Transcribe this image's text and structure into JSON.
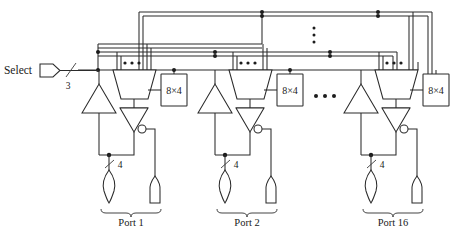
{
  "figure": {
    "type": "circuit-schematic",
    "input_label": "Select",
    "select_bus_width": "3",
    "port_bus_width": "4",
    "decoder_label": "8×4",
    "horizontal_ellipsis": "•••",
    "vertical_ellipsis": "⋮",
    "mux_ellipsis": "•••"
  },
  "ports": [
    {
      "id": "port-1",
      "label": "Port 1",
      "decoder": "8×4",
      "bus_width": "4",
      "mux_dots": "•••"
    },
    {
      "id": "port-2",
      "label": "Port 2",
      "decoder": "8×4",
      "bus_width": "4",
      "mux_dots": "•••"
    },
    {
      "id": "port-16",
      "label": "Port 16",
      "decoder": "8×4",
      "bus_width": "4",
      "mux_dots": "•••"
    }
  ],
  "colors": {
    "line": "#2b2b2b",
    "background": "#ffffff",
    "text": "#1a1a1a"
  }
}
